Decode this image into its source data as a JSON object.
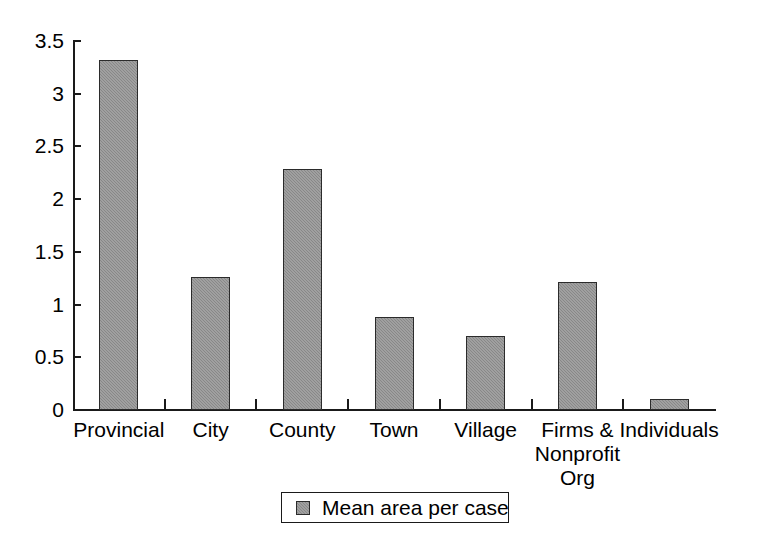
{
  "chart_data": {
    "type": "bar",
    "title": "",
    "subtitle": "",
    "xlabel": "",
    "ylabel": "",
    "categories": [
      "Provincial",
      "City",
      "County",
      "Town",
      "Village",
      "Firms &\nNonprofit\nOrg",
      "Individuals"
    ],
    "values": [
      3.32,
      1.26,
      2.29,
      0.88,
      0.7,
      1.21,
      0.1
    ],
    "series": [
      {
        "name": "Mean area per case",
        "values": [
          3.32,
          1.26,
          2.29,
          0.88,
          0.7,
          1.21,
          0.1
        ],
        "color": "#888888"
      }
    ],
    "ylim": [
      0,
      3.5
    ],
    "yticks": [
      0,
      0.5,
      1,
      1.5,
      2,
      2.5,
      3,
      3.5
    ],
    "ytick_labels": [
      "0",
      "0.5",
      "1",
      "1.5",
      "2",
      "2.5",
      "3",
      "3.5"
    ],
    "grid": false,
    "legend": {
      "position": "bottom-center",
      "entries": [
        {
          "label": "Mean area per case",
          "color": "#888888"
        }
      ]
    },
    "colors": {
      "bar_fill": "#888888",
      "bar_border": "#2b2b2b",
      "axis": "#1a1a1a",
      "text": "#000000",
      "background": "#ffffff"
    }
  }
}
